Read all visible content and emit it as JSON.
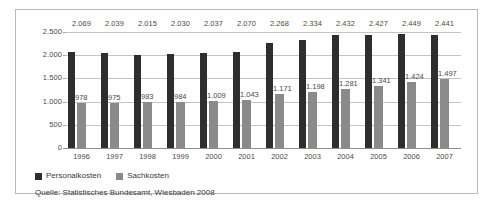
{
  "chart_data": {
    "type": "bar",
    "title": "",
    "xlabel": "",
    "ylabel": "",
    "ylim": [
      0,
      2500
    ],
    "yticks": [
      0,
      500,
      1000,
      1500,
      2000,
      2500
    ],
    "ytick_labels": [
      "0",
      "500",
      "1.000",
      "1.500",
      "2.000",
      "2.500"
    ],
    "grid": true,
    "legend_position": "below-left",
    "categories": [
      "1996",
      "1997",
      "1998",
      "1999",
      "2000",
      "2001",
      "2002",
      "2003",
      "2004",
      "2005",
      "2006",
      "2007"
    ],
    "series": [
      {
        "name": "Personalkosten",
        "color": "#2e2e2e",
        "values": [
          2069,
          2039,
          2015,
          2030,
          2037,
          2070,
          2268,
          2334,
          2432,
          2427,
          2449,
          2441
        ],
        "labels": [
          "2.069",
          "2.039",
          "2.015",
          "2.030",
          "2.037",
          "2.070",
          "2.268",
          "2.334",
          "2.432",
          "2.427",
          "2.449",
          "2.441"
        ]
      },
      {
        "name": "Sachkosten",
        "color": "#8a8a8a",
        "values": [
          978,
          975,
          983,
          984,
          1009,
          1043,
          1171,
          1198,
          1281,
          1341,
          1424,
          1497
        ],
        "labels": [
          "978",
          "975",
          "983",
          "984",
          "1.009",
          "1.043",
          "1.171",
          "1.198",
          "1.281",
          "1.341",
          "1.424",
          "1.497"
        ]
      }
    ],
    "source": "Quelle: Statistisches Bundesamt, Wiesbaden 2008"
  }
}
